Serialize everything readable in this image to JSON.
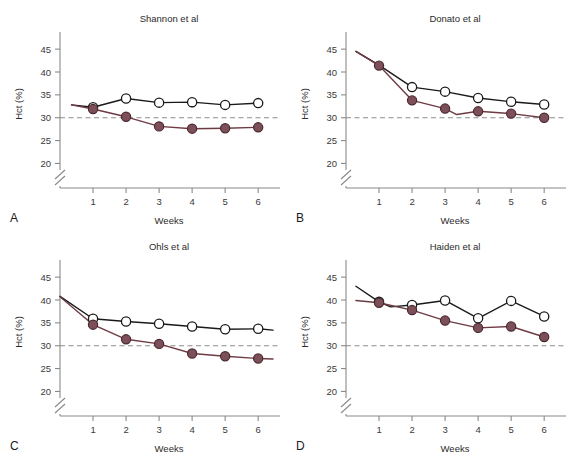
{
  "figure": {
    "background": "#ffffff",
    "panel_letters": [
      "A",
      "B",
      "C",
      "D"
    ]
  },
  "axes": {
    "ylabel": "Hct (%)",
    "xlabel": "Weeks",
    "yticks": [
      20,
      25,
      30,
      35,
      40,
      45
    ],
    "xticks": [
      1,
      2,
      3,
      4,
      5,
      6
    ],
    "ylim": [
      19,
      47
    ],
    "xlim": [
      0,
      6.6
    ],
    "axis_break": true,
    "reference_line_value": 30
  },
  "colors": {
    "control_line": "#1a1a1a",
    "treated_line": "#6e3b44",
    "treated_fill": "#7d4f58",
    "open_marker_fill": "#ffffff",
    "reference_line": "#8d8d8d",
    "axis": "#8a8a8a",
    "text": "#2b2b2b"
  },
  "chart_data": [
    {
      "type": "line",
      "panel": "A",
      "title": "Shannon et al",
      "xlabel": "Weeks",
      "ylabel": "Hct (%)",
      "ylim": [
        19,
        47
      ],
      "xlim": [
        0,
        6.6
      ],
      "yticks": [
        20,
        25,
        30,
        35,
        40,
        45
      ],
      "xticks": [
        1,
        2,
        3,
        4,
        5,
        6
      ],
      "grid": false,
      "legend": "none",
      "reference_line": 30,
      "series": [
        {
          "name": "control",
          "marker": "open-circle",
          "x": [
            0.35,
            1,
            2,
            3,
            4,
            5,
            6
          ],
          "values": [
            32.8,
            32.3,
            34.2,
            33.3,
            33.4,
            32.8,
            33.2
          ],
          "markers_at": [
            1,
            2,
            3,
            4,
            5,
            6
          ]
        },
        {
          "name": "treated",
          "marker": "filled-circle",
          "x": [
            0.35,
            1,
            2,
            3,
            4,
            5,
            6
          ],
          "values": [
            32.8,
            31.9,
            30.2,
            28.1,
            27.6,
            27.7,
            27.9
          ],
          "markers_at": [
            1,
            2,
            3,
            4,
            5,
            6
          ]
        }
      ]
    },
    {
      "type": "line",
      "panel": "B",
      "title": "Donato et al",
      "xlabel": "Weeks",
      "ylabel": "Hct (%)",
      "ylim": [
        19,
        47
      ],
      "xlim": [
        0,
        6.6
      ],
      "yticks": [
        20,
        25,
        30,
        35,
        40,
        45
      ],
      "xticks": [
        1,
        2,
        3,
        4,
        5,
        6
      ],
      "grid": false,
      "legend": "none",
      "reference_line": 30,
      "series": [
        {
          "name": "control",
          "marker": "open-circle",
          "x": [
            0.3,
            1,
            2,
            3,
            4,
            5,
            6
          ],
          "values": [
            44.5,
            41.5,
            36.7,
            35.7,
            34.3,
            33.5,
            32.9
          ],
          "markers_at": [
            2,
            3,
            4,
            5,
            6
          ]
        },
        {
          "name": "treated",
          "marker": "filled-circle",
          "x": [
            0.3,
            1,
            2,
            3,
            3.35,
            4,
            5,
            6
          ],
          "values": [
            44.5,
            41.4,
            33.8,
            32.0,
            30.7,
            31.4,
            30.9,
            30.0
          ],
          "markers_at": [
            1,
            2,
            3,
            4,
            5,
            6
          ]
        }
      ]
    },
    {
      "type": "line",
      "panel": "C",
      "title": "Ohls et al",
      "xlabel": "Weeks",
      "ylabel": "Hct (%)",
      "ylim": [
        19,
        47
      ],
      "xlim": [
        0,
        6.6
      ],
      "yticks": [
        20,
        25,
        30,
        35,
        40,
        45
      ],
      "xticks": [
        1,
        2,
        3,
        4,
        5,
        6
      ],
      "grid": false,
      "legend": "none",
      "reference_line": 30,
      "series": [
        {
          "name": "control",
          "marker": "open-circle",
          "x": [
            0,
            1,
            2,
            3,
            4,
            5,
            6,
            6.45
          ],
          "values": [
            40.8,
            35.9,
            35.3,
            34.8,
            34.2,
            33.6,
            33.7,
            33.4
          ],
          "markers_at": [
            1,
            2,
            3,
            4,
            5,
            6
          ]
        },
        {
          "name": "treated",
          "marker": "filled-circle",
          "x": [
            0,
            1,
            2,
            3,
            4,
            5,
            6,
            6.45
          ],
          "values": [
            40.7,
            34.6,
            31.4,
            30.4,
            28.3,
            27.7,
            27.2,
            27.1
          ],
          "markers_at": [
            1,
            2,
            3,
            4,
            5,
            6
          ]
        }
      ]
    },
    {
      "type": "line",
      "panel": "D",
      "title": "Haiden et al",
      "xlabel": "Weeks",
      "ylabel": "Hct (%)",
      "ylim": [
        19,
        47
      ],
      "xlim": [
        0,
        6.6
      ],
      "yticks": [
        20,
        25,
        30,
        35,
        40,
        45
      ],
      "xticks": [
        1,
        2,
        3,
        4,
        5,
        6
      ],
      "grid": false,
      "legend": "none",
      "reference_line": 30,
      "series": [
        {
          "name": "control",
          "marker": "open-circle",
          "x": [
            0.3,
            1,
            1.35,
            2,
            3,
            4,
            5,
            6
          ],
          "values": [
            43.0,
            39.6,
            38.5,
            38.9,
            39.9,
            36.0,
            39.8,
            36.4
          ],
          "markers_at": [
            1,
            2,
            3,
            4,
            5,
            6
          ]
        },
        {
          "name": "treated",
          "marker": "filled-circle",
          "x": [
            0.3,
            1,
            2,
            3,
            4,
            5,
            6
          ],
          "values": [
            39.9,
            39.4,
            37.8,
            35.5,
            33.9,
            34.2,
            31.9
          ],
          "markers_at": [
            1,
            2,
            3,
            4,
            5,
            6
          ]
        }
      ]
    }
  ]
}
